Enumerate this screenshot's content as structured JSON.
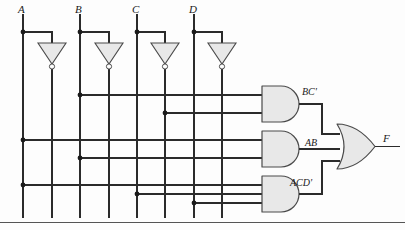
{
  "diagram": {
    "colors": {
      "wire": "#2b2b2b",
      "gate_fill": "#e8e8e8",
      "gate_stroke": "#4a4a4a",
      "rule": "#555555",
      "background": "#fdfdfd"
    },
    "inputs": [
      {
        "label": "A",
        "rail_x": 23,
        "inv_rail_x": 52
      },
      {
        "label": "B",
        "rail_x": 80,
        "inv_rail_x": 109
      },
      {
        "label": "C",
        "rail_x": 137,
        "inv_rail_x": 165
      },
      {
        "label": "D",
        "rail_x": 194,
        "inv_rail_x": 222
      }
    ],
    "inverters": [
      {
        "name": "inverter-a",
        "input": "A",
        "output": "A'"
      },
      {
        "name": "inverter-b",
        "input": "B",
        "output": "B'"
      },
      {
        "name": "inverter-c",
        "input": "C",
        "output": "C'"
      },
      {
        "name": "inverter-d",
        "input": "D",
        "output": "D'"
      }
    ],
    "and_gates": [
      {
        "name": "and-gate-bc-prime",
        "label": "BC'",
        "inputs": [
          "B",
          "C'"
        ],
        "input_rows": [
          {
            "signal": "B",
            "y": 95,
            "from_x": 80
          },
          {
            "signal": "C'",
            "y": 113,
            "from_x": 165
          }
        ]
      },
      {
        "name": "and-gate-ab",
        "label": "AB",
        "inputs": [
          "A",
          "B"
        ],
        "input_rows": [
          {
            "signal": "A",
            "y": 140,
            "from_x": 23
          },
          {
            "signal": "B",
            "y": 158,
            "from_x": 80
          }
        ]
      },
      {
        "name": "and-gate-acd-prime",
        "label": "ACD'",
        "inputs": [
          "A",
          "C",
          "D'"
        ],
        "input_rows": [
          {
            "signal": "A",
            "y": 185,
            "from_x": 23
          },
          {
            "signal": "C",
            "y": 194,
            "from_x": 137
          },
          {
            "signal": "D'",
            "y": 203,
            "from_x": 194
          }
        ]
      }
    ],
    "or_gate": {
      "name": "or-gate",
      "inputs": [
        "BC'",
        "AB",
        "ACD'"
      ]
    },
    "output": {
      "label": "F",
      "expression": "BC' + AB + ACD'"
    }
  }
}
